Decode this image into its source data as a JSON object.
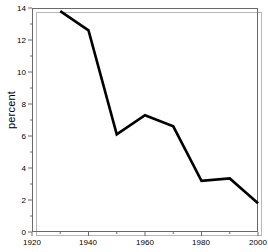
{
  "chart_data": {
    "type": "line",
    "title": "",
    "xlabel": "",
    "ylabel": "percent",
    "xlim": [
      1920,
      2000
    ],
    "ylim": [
      0,
      14
    ],
    "grid": false,
    "legend": null,
    "x_ticks": [
      "1920",
      "1940",
      "1960",
      "1980",
      "2000"
    ],
    "x_tick_values": [
      1920,
      1940,
      1960,
      1980,
      2000
    ],
    "x_minor_tick_values": [
      1930,
      1950,
      1970,
      1990
    ],
    "y_ticks": [
      "0",
      "2",
      "4",
      "6",
      "8",
      "10",
      "12",
      "14"
    ],
    "y_tick_values": [
      0,
      2,
      4,
      6,
      8,
      10,
      12,
      14
    ],
    "y_minor_tick_values": [
      1,
      3,
      5,
      7,
      9,
      11,
      13
    ],
    "series": [
      {
        "name": "percent",
        "color": "#000000",
        "x": [
          1930,
          1940,
          1950,
          1960,
          1970,
          1980,
          1990,
          2000
        ],
        "values": [
          13.8,
          12.6,
          6.1,
          7.3,
          6.6,
          3.2,
          3.35,
          1.8
        ]
      }
    ]
  },
  "figure": {
    "background": "#ffffff",
    "axis_color": "#6a6a6a",
    "shadow_color": "#b8b8b8",
    "line_color": "#000000"
  }
}
